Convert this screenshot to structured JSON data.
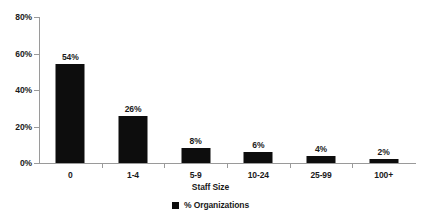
{
  "chart_data": {
    "type": "bar",
    "title": "",
    "subtitle": "",
    "xlabel": "Staff Size",
    "ylabel": "",
    "categories": [
      "0",
      "1-4",
      "5-9",
      "10-24",
      "25-99",
      "100+"
    ],
    "values": [
      54,
      26,
      8,
      6,
      4,
      2
    ],
    "data_labels": [
      "54%",
      "26%",
      "8%",
      "6%",
      "4%",
      "2%"
    ],
    "series": [
      {
        "name": "% Organizations",
        "values": [
          54,
          26,
          8,
          6,
          4,
          2
        ],
        "color": "#0d0d0d"
      }
    ],
    "ylim": [
      0,
      80
    ],
    "ytick_values": [
      0,
      20,
      40,
      60,
      80
    ],
    "ytick_labels": [
      "0%",
      "20%",
      "40%",
      "60%",
      "80%"
    ],
    "grid": false,
    "legend_position": "bottom",
    "legend_entries": [
      "% Organizations"
    ],
    "axis_color": "#9a9a9a",
    "text_color": "#1a1a1a",
    "background": "#ffffff"
  },
  "legend": {
    "items": [
      {
        "label": "% Organizations",
        "swatch_icon": "filled-square-marker"
      }
    ]
  }
}
